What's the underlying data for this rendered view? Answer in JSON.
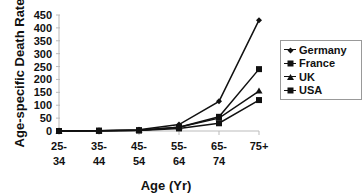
{
  "chart_data": {
    "type": "line",
    "title": "",
    "xlabel": "Age (Yr)",
    "ylabel": "Age-specific Death Rate",
    "categories": [
      "25-34",
      "35-44",
      "45-54",
      "55-64",
      "65-74",
      "75+"
    ],
    "category_lines": [
      [
        "25-",
        "34"
      ],
      [
        "35-",
        "44"
      ],
      [
        "45-",
        "54"
      ],
      [
        "55-",
        "64"
      ],
      [
        "65-",
        "74"
      ],
      [
        "75+",
        ""
      ]
    ],
    "ylim": [
      0,
      450
    ],
    "yticks": [
      0,
      50,
      100,
      150,
      200,
      250,
      300,
      350,
      400,
      450
    ],
    "grid": false,
    "legend_position": "right",
    "series": [
      {
        "name": "Germany",
        "marker": "diamond",
        "values": [
          0,
          1,
          5,
          25,
          115,
          430
        ]
      },
      {
        "name": "France",
        "marker": "square",
        "values": [
          0,
          1,
          3,
          15,
          55,
          240
        ]
      },
      {
        "name": "UK",
        "marker": "triangle",
        "values": [
          0,
          1,
          3,
          15,
          50,
          155
        ]
      },
      {
        "name": "USA",
        "marker": "square",
        "values": [
          0,
          1,
          2,
          10,
          30,
          120
        ]
      }
    ]
  }
}
